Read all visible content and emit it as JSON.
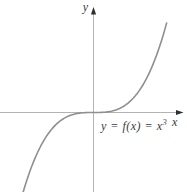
{
  "figure": {
    "colors": {
      "background": "#ffffff",
      "axis": "#b3b3b3",
      "arrow": "#2f2f2f",
      "curve": "#8f8f8f",
      "text": "#3a3a3a"
    }
  },
  "labels": {
    "y_axis": "y",
    "x_axis": "x",
    "equation_main": "y = f(x) = x",
    "equation_exponent": "3"
  },
  "chart_data": {
    "type": "line",
    "title": "",
    "function": "y = f(x) = x^3",
    "xlabel": "x",
    "ylabel": "y",
    "exponent": 3,
    "x_domain": [
      -2.14,
      2.09
    ],
    "points": {
      "x": [
        -2,
        -1.5,
        -1,
        -0.5,
        0,
        0.5,
        1,
        1.5,
        2
      ],
      "y": [
        -8,
        -3.375,
        -1,
        -0.125,
        0,
        0.125,
        1,
        3.375,
        8
      ]
    },
    "grid": false,
    "legend": false,
    "axes_through_origin": true,
    "annotation": "y = f(x) = x3 (exponent superscript)",
    "layout": {
      "pixel_mapping": {
        "origin_x": 93.5,
        "origin_y": 112.5,
        "px_per_unit_x": 35,
        "px_per_unit_y": 9.8,
        "clip_top": 14,
        "clip_bottom": 192
      }
    }
  }
}
